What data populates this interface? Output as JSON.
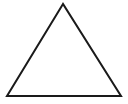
{
  "diagram": {
    "shape": "triangle",
    "type": "equilateral-ish outline",
    "stroke_color": "#1a1a1a",
    "fill_color": "#ffffff",
    "stroke_width": 2,
    "vertices": {
      "apex": [
        63,
        4
      ],
      "bottom_left": [
        7,
        96
      ],
      "bottom_right": [
        121,
        96
      ]
    }
  }
}
